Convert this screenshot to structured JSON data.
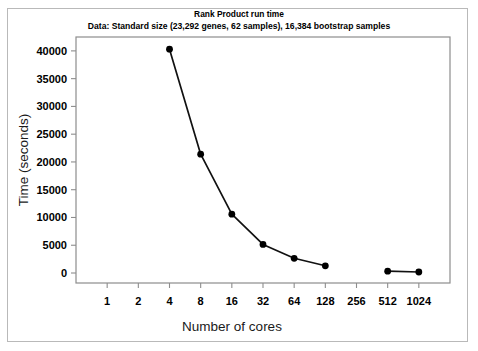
{
  "chart_data": {
    "type": "line",
    "title": "Rank Product run time",
    "subtitle": "Data: Standard size (23,292 genes, 62 samples), 16,384 bootstrap samples",
    "xlabel": "Number of cores",
    "ylabel": "Time (seconds)",
    "x_scale": "log2",
    "x_tick_labels": [
      "1",
      "2",
      "4",
      "8",
      "16",
      "32",
      "64",
      "128",
      "256",
      "512",
      "1024"
    ],
    "x_tick_values": [
      1,
      2,
      4,
      8,
      16,
      32,
      64,
      128,
      256,
      512,
      1024
    ],
    "y_tick_labels": [
      "0",
      "5000",
      "10000",
      "15000",
      "20000",
      "25000",
      "30000",
      "35000",
      "40000"
    ],
    "y_tick_values": [
      0,
      5000,
      10000,
      15000,
      20000,
      25000,
      30000,
      35000,
      40000
    ],
    "ylim": [
      -1800,
      42500
    ],
    "xlim": [
      1,
      1024
    ],
    "grid": false,
    "legend": null,
    "series": [
      {
        "name": "Rank Product run time",
        "marker": "filled-circle",
        "color": "#000000",
        "segments": [
          {
            "x": [
              4,
              8,
              16,
              32,
              64,
              128
            ],
            "y": [
              40300,
              21400,
              10600,
              5150,
              2650,
              1300
            ]
          },
          {
            "x": [
              512,
              1024
            ],
            "y": [
              330,
              180
            ]
          }
        ]
      }
    ],
    "points": [
      {
        "x": 4,
        "y": 40300
      },
      {
        "x": 8,
        "y": 21400
      },
      {
        "x": 16,
        "y": 10600
      },
      {
        "x": 32,
        "y": 5150
      },
      {
        "x": 64,
        "y": 2650
      },
      {
        "x": 128,
        "y": 1300
      },
      {
        "x": 512,
        "y": 330
      },
      {
        "x": 1024,
        "y": 180
      }
    ]
  },
  "colors": {
    "figure_border": "#b9b9b9",
    "axis": "#8d8d8d",
    "series": "#000000",
    "background": "#ffffff"
  }
}
